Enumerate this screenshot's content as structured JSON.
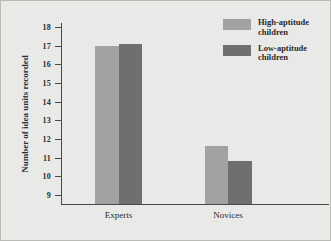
{
  "chart_data": {
    "type": "bar",
    "title": "",
    "xlabel": "",
    "ylabel": "Number of idea units recorded",
    "categories": [
      "Experts",
      "Novices"
    ],
    "ylim": [
      8.6,
      18
    ],
    "yticks": [
      18,
      17,
      16,
      15,
      14,
      13,
      12,
      11,
      10,
      9
    ],
    "grid": false,
    "legend_position": "top-right",
    "series": [
      {
        "name": "High-aptitude children",
        "color": "#a2a2a0",
        "values": [
          17.0,
          11.65
        ]
      },
      {
        "name": "Low-aptitude children",
        "color": "#6f6f6d",
        "values": [
          17.1,
          10.8
        ]
      }
    ]
  },
  "axis": {
    "y_title": "Number of idea units recorded",
    "tick_labels": [
      "18",
      "17",
      "16",
      "15",
      "14",
      "13",
      "12",
      "11",
      "10",
      "9"
    ],
    "category_labels": [
      "Experts",
      "Novices"
    ]
  },
  "legend": {
    "entries": [
      {
        "label": "High-aptitude\nchildren",
        "color": "#a2a2a0",
        "swatch_name": "legend-swatch-high-aptitude"
      },
      {
        "label": "Low-aptitude\nchildren",
        "color": "#6f6f6d",
        "swatch_name": "legend-swatch-low-aptitude"
      }
    ]
  },
  "colors": {
    "background": "#e9e9e7",
    "axis": "#4a4a48",
    "text": "#2b2b2b",
    "series_light": "#a2a2a0",
    "series_dark": "#6f6f6d"
  }
}
